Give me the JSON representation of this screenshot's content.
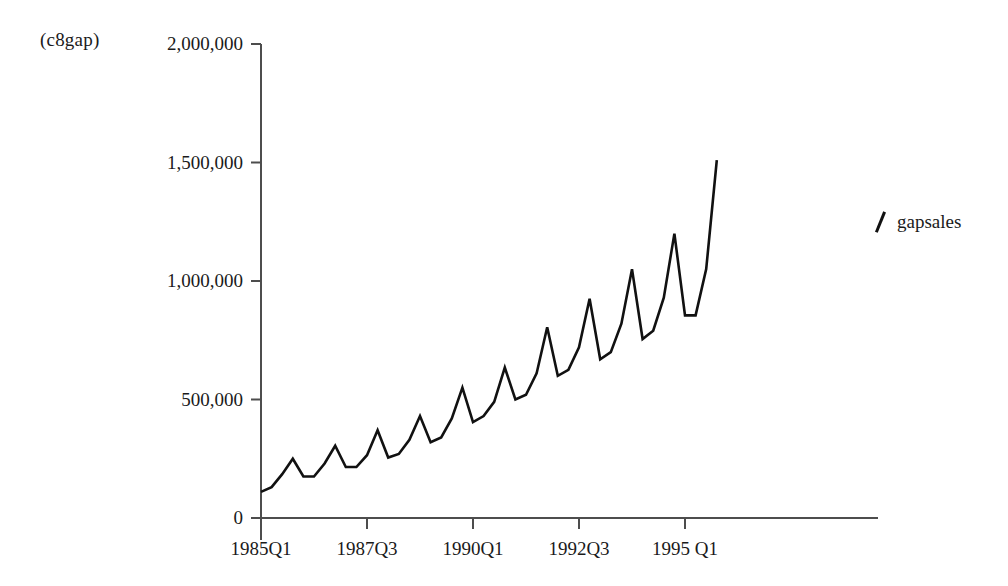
{
  "chart_data": {
    "type": "line",
    "title": "(c8gap)",
    "xlabel": "",
    "ylabel": "",
    "ylim": [
      0,
      2000000
    ],
    "grid": false,
    "legend_position": "right",
    "series": [
      {
        "name": "gapsales",
        "x": [
          "1985Q1",
          "1985Q2",
          "1985Q3",
          "1985Q4",
          "1986Q1",
          "1986Q2",
          "1986Q3",
          "1986Q4",
          "1987Q1",
          "1987Q2",
          "1987Q3",
          "1987Q4",
          "1988Q1",
          "1988Q2",
          "1988Q3",
          "1988Q4",
          "1989Q1",
          "1989Q2",
          "1989Q3",
          "1989Q4",
          "1990Q1",
          "1990Q2",
          "1990Q3",
          "1990Q4",
          "1991Q1",
          "1991Q2",
          "1991Q3",
          "1991Q4",
          "1992Q1",
          "1992Q2",
          "1992Q3",
          "1992Q4",
          "1993Q1",
          "1993Q2",
          "1993Q3",
          "1993Q4",
          "1994Q1",
          "1994Q2",
          "1994Q3",
          "1994Q4",
          "1995Q1",
          "1995Q2",
          "1995Q3",
          "1995Q4"
        ],
        "values": [
          110000,
          130000,
          185000,
          250000,
          175000,
          175000,
          230000,
          305000,
          215000,
          215000,
          265000,
          370000,
          255000,
          270000,
          330000,
          430000,
          320000,
          340000,
          420000,
          550000,
          405000,
          430000,
          490000,
          635000,
          500000,
          520000,
          610000,
          805000,
          600000,
          625000,
          720000,
          925000,
          670000,
          700000,
          820000,
          1050000,
          755000,
          790000,
          930000,
          1200000,
          855000,
          855000,
          1050000,
          1510000
        ]
      }
    ],
    "y_ticks": [
      {
        "value": 2000000,
        "label": "2,000,000"
      },
      {
        "value": 1500000,
        "label": "1,500,000"
      },
      {
        "value": 1000000,
        "label": "1,000,000"
      },
      {
        "value": 500000,
        "label": "500,000"
      },
      {
        "value": 0,
        "label": "0"
      }
    ],
    "x_ticks": [
      {
        "index": 0,
        "label": "1985Q1"
      },
      {
        "index": 10,
        "label": "1987Q3"
      },
      {
        "index": 20,
        "label": "1990Q1"
      },
      {
        "index": 30,
        "label": "1992Q3"
      },
      {
        "index": 40,
        "label": "1995 Q1"
      }
    ],
    "line_color": "#111111",
    "axis_color": "#4d4d4d"
  }
}
